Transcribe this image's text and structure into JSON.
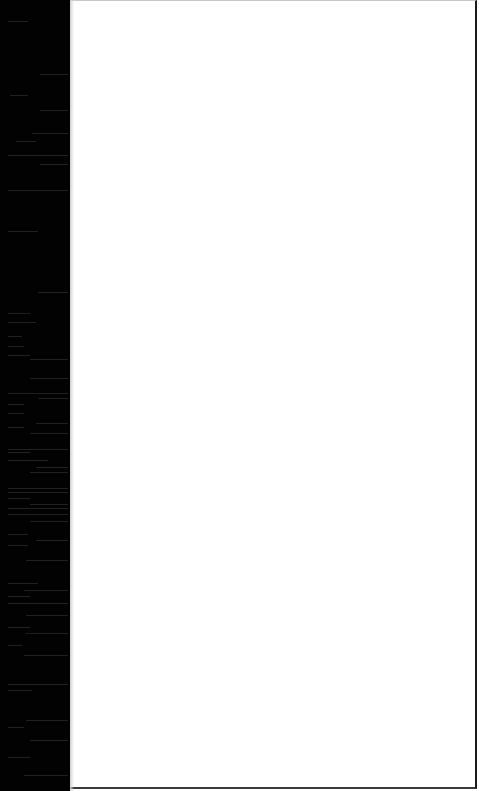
{
  "window": {
    "left_strip": {
      "color": "#020202",
      "width_px": 70
    },
    "panel": {
      "background": "#ffffff",
      "border_right": "#1a1a1a",
      "border_bottom": "#3a3a3a",
      "border_top": "#c8c8c8"
    }
  },
  "streaks": [
    {
      "top": 21,
      "left": 8,
      "width": 20
    },
    {
      "top": 74,
      "left": 40,
      "width": 28
    },
    {
      "top": 95,
      "left": 10,
      "width": 18
    },
    {
      "top": 110,
      "left": 40,
      "width": 28
    },
    {
      "top": 133,
      "left": 32,
      "width": 36
    },
    {
      "top": 141,
      "left": 16,
      "width": 20
    },
    {
      "top": 155,
      "left": 8,
      "width": 60
    },
    {
      "top": 164,
      "left": 40,
      "width": 28
    },
    {
      "top": 190,
      "left": 8,
      "width": 60
    },
    {
      "top": 231,
      "left": 8,
      "width": 30
    },
    {
      "top": 292,
      "left": 38,
      "width": 30
    },
    {
      "top": 313,
      "left": 8,
      "width": 22
    },
    {
      "top": 322,
      "left": 8,
      "width": 28
    },
    {
      "top": 336,
      "left": 8,
      "width": 14
    },
    {
      "top": 346,
      "left": 8,
      "width": 16
    },
    {
      "top": 355,
      "left": 8,
      "width": 22
    },
    {
      "top": 359,
      "left": 30,
      "width": 38
    },
    {
      "top": 378,
      "left": 30,
      "width": 38
    },
    {
      "top": 393,
      "left": 8,
      "width": 60
    },
    {
      "top": 398,
      "left": 38,
      "width": 30
    },
    {
      "top": 404,
      "left": 8,
      "width": 16
    },
    {
      "top": 413,
      "left": 8,
      "width": 16
    },
    {
      "top": 427,
      "left": 8,
      "width": 16
    },
    {
      "top": 423,
      "left": 36,
      "width": 32
    },
    {
      "top": 433,
      "left": 30,
      "width": 38
    },
    {
      "top": 449,
      "left": 8,
      "width": 60
    },
    {
      "top": 452,
      "left": 8,
      "width": 22
    },
    {
      "top": 460,
      "left": 8,
      "width": 40
    },
    {
      "top": 467,
      "left": 36,
      "width": 32
    },
    {
      "top": 472,
      "left": 30,
      "width": 38
    },
    {
      "top": 488,
      "left": 8,
      "width": 60
    },
    {
      "top": 492,
      "left": 8,
      "width": 60
    },
    {
      "top": 498,
      "left": 8,
      "width": 22
    },
    {
      "top": 504,
      "left": 30,
      "width": 38
    },
    {
      "top": 508,
      "left": 8,
      "width": 60
    },
    {
      "top": 514,
      "left": 8,
      "width": 60
    },
    {
      "top": 521,
      "left": 30,
      "width": 38
    },
    {
      "top": 534,
      "left": 8,
      "width": 20
    },
    {
      "top": 540,
      "left": 36,
      "width": 32
    },
    {
      "top": 545,
      "left": 8,
      "width": 20
    },
    {
      "top": 560,
      "left": 26,
      "width": 42
    },
    {
      "top": 583,
      "left": 8,
      "width": 30
    },
    {
      "top": 590,
      "left": 24,
      "width": 44
    },
    {
      "top": 596,
      "left": 8,
      "width": 22
    },
    {
      "top": 603,
      "left": 8,
      "width": 60
    },
    {
      "top": 615,
      "left": 26,
      "width": 42
    },
    {
      "top": 627,
      "left": 8,
      "width": 22
    },
    {
      "top": 633,
      "left": 26,
      "width": 42
    },
    {
      "top": 645,
      "left": 8,
      "width": 14
    },
    {
      "top": 655,
      "left": 24,
      "width": 44
    },
    {
      "top": 684,
      "left": 8,
      "width": 60
    },
    {
      "top": 690,
      "left": 8,
      "width": 24
    },
    {
      "top": 720,
      "left": 26,
      "width": 42
    },
    {
      "top": 727,
      "left": 8,
      "width": 16
    },
    {
      "top": 740,
      "left": 30,
      "width": 38
    },
    {
      "top": 757,
      "left": 8,
      "width": 22
    },
    {
      "top": 775,
      "left": 24,
      "width": 44
    }
  ]
}
